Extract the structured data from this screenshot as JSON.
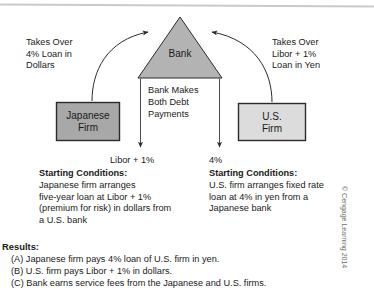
{
  "diagram": {
    "nodes": {
      "bank": {
        "label": "Bank",
        "shape": "triangle",
        "fill": "#b3b3b3"
      },
      "japanese_firm": {
        "label": "Japanese\nFirm",
        "shape": "rectangle",
        "fill": "#a8a8a8"
      },
      "us_firm": {
        "label": "U.S.\nFirm",
        "shape": "rectangle",
        "fill": "#dcdcdc"
      }
    },
    "bank_center_note": "Bank Makes\nBoth Debt\nPayments",
    "flows": {
      "left_takeover": "Takes Over\n4% Loan in\nDollars",
      "right_takeover": "Takes Over\nLibor + 1%\nLoan in Yen",
      "left_rate": "Libor + 1%",
      "right_rate": "4%"
    }
  },
  "conditions": {
    "left": {
      "title": "Starting Conditions:",
      "body": "Japanese firm arranges\nfive-year loan at Libor + 1%\n(premium for risk) in dollars from\na U.S. bank"
    },
    "right": {
      "title": "Starting Conditions:",
      "body": "U.S. firm arranges fixed rate\nloan at 4% in yen from a\nJapanese bank"
    }
  },
  "results": {
    "title": "Results:",
    "items": [
      "(A) Japanese firm pays 4% loan of U.S. firm in yen.",
      "(B) U.S. firm pays Libor + 1% in dollars.",
      "(C) Bank earns service fees from the Japanese and U.S. firms."
    ]
  },
  "copyright": "© Cengage Learning 2014",
  "colors": {
    "bank_fill": "#b3b3b3",
    "japanese_fill": "#a8a8a8",
    "us_fill": "#dcdcdc",
    "stroke": "#2b2b2b",
    "top_rule": "#c8c8c8"
  }
}
